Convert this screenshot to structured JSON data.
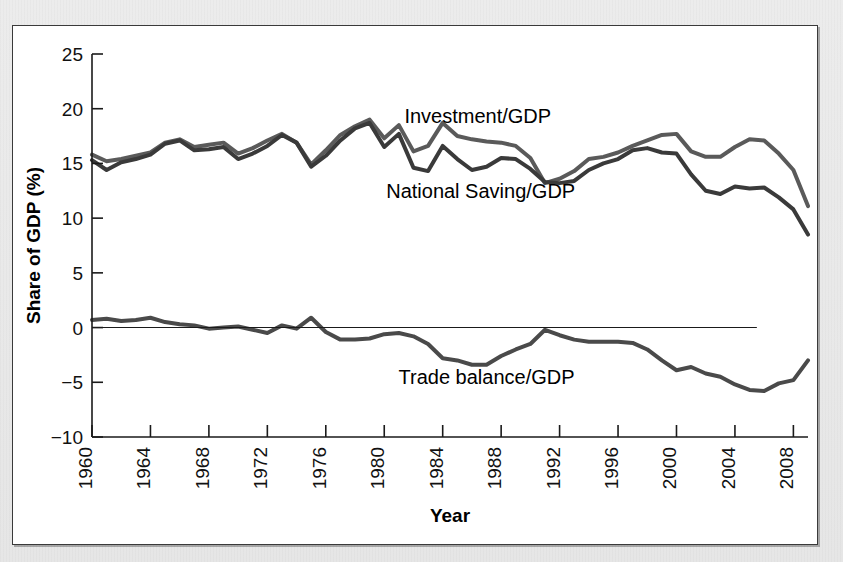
{
  "figure": {
    "background_color": "#e8e8e8",
    "panel_color": "#ffffff",
    "frame_color": "#3a3a3a"
  },
  "chart_data": {
    "type": "line",
    "title": "",
    "subtitle": "",
    "xlabel": "Year",
    "ylabel": "Share of GDP (%)",
    "xlim": [
      1960,
      2009
    ],
    "ylim": [
      -10,
      25
    ],
    "ytick_values": [
      25,
      20,
      15,
      10,
      5,
      0,
      -5,
      -10
    ],
    "ytick_labels": [
      "25",
      "20",
      "15",
      "10",
      "5",
      "0",
      "−5",
      "−10"
    ],
    "xtick_values": [
      1960,
      1964,
      1968,
      1972,
      1976,
      1980,
      1984,
      1988,
      1992,
      1996,
      2000,
      2004,
      2008
    ],
    "xtick_labels": [
      "1960",
      "1964",
      "1968",
      "1972",
      "1976",
      "1980",
      "1984",
      "1988",
      "1992",
      "1996",
      "2000",
      "2004",
      "2008"
    ],
    "grid": false,
    "legend_position": "inline-annotations",
    "zero_reference_line": 0,
    "x": [
      1960,
      1961,
      1962,
      1963,
      1964,
      1965,
      1966,
      1967,
      1968,
      1969,
      1970,
      1971,
      1972,
      1973,
      1974,
      1975,
      1976,
      1977,
      1978,
      1979,
      1980,
      1981,
      1982,
      1983,
      1984,
      1985,
      1986,
      1987,
      1988,
      1989,
      1990,
      1991,
      1992,
      1993,
      1994,
      1995,
      1996,
      1997,
      1998,
      1999,
      2000,
      2001,
      2002,
      2003,
      2004,
      2005,
      2006,
      2007,
      2008,
      2009
    ],
    "series": [
      {
        "name": "Investment/GDP",
        "color": "#5a5a5a",
        "line_width": 4.0,
        "label_x": 1986.4,
        "label_y": 19.2,
        "values": [
          15.8,
          15.2,
          15.4,
          15.7,
          16.0,
          16.9,
          17.2,
          16.5,
          16.7,
          16.9,
          15.9,
          16.4,
          17.1,
          17.7,
          16.9,
          14.9,
          16.2,
          17.6,
          18.4,
          19.0,
          17.3,
          18.5,
          16.1,
          16.6,
          18.7,
          17.5,
          17.2,
          17.0,
          16.9,
          16.6,
          15.5,
          13.2,
          13.6,
          14.3,
          15.4,
          15.6,
          16.0,
          16.6,
          17.1,
          17.6,
          17.7,
          16.1,
          15.6,
          15.6,
          16.5,
          17.2,
          17.1,
          15.9,
          14.4,
          11.1
        ]
      },
      {
        "name": "National Saving/GDP",
        "color": "#3a3a3a",
        "line_width": 4.0,
        "label_x": 1986.6,
        "label_y": 12.4,
        "values": [
          15.3,
          14.4,
          15.1,
          15.4,
          15.8,
          16.8,
          17.1,
          16.2,
          16.3,
          16.5,
          15.4,
          15.9,
          16.6,
          17.6,
          16.9,
          14.7,
          15.7,
          17.1,
          18.2,
          18.7,
          16.5,
          17.7,
          14.6,
          14.3,
          16.6,
          15.4,
          14.4,
          14.7,
          15.5,
          15.4,
          14.5,
          13.3,
          13.2,
          13.4,
          14.4,
          15.0,
          15.4,
          16.2,
          16.4,
          16.0,
          15.9,
          14.0,
          12.5,
          12.2,
          12.9,
          12.7,
          12.8,
          11.9,
          10.8,
          8.5
        ]
      },
      {
        "name": "Trade balance/GDP",
        "color": "#4a4a4a",
        "line_width": 4.0,
        "label_x": 1987.0,
        "label_y": -4.6,
        "values": [
          0.7,
          0.8,
          0.6,
          0.7,
          0.9,
          0.5,
          0.3,
          0.2,
          -0.1,
          0.0,
          0.1,
          -0.2,
          -0.5,
          0.2,
          -0.1,
          0.9,
          -0.4,
          -1.1,
          -1.1,
          -1.0,
          -0.6,
          -0.5,
          -0.8,
          -1.5,
          -2.8,
          -3.0,
          -3.4,
          -3.4,
          -2.6,
          -2.0,
          -1.5,
          -0.2,
          -0.7,
          -1.1,
          -1.3,
          -1.3,
          -1.3,
          -1.4,
          -2.0,
          -3.0,
          -3.9,
          -3.6,
          -4.2,
          -4.5,
          -5.2,
          -5.7,
          -5.8,
          -5.1,
          -4.8,
          -3.0
        ]
      }
    ]
  }
}
